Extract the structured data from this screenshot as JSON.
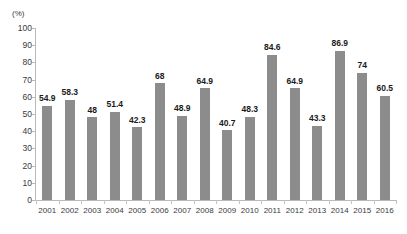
{
  "chart_data": {
    "type": "bar",
    "title": "",
    "subtitle": "",
    "xlabel": "",
    "ylabel": "(%)",
    "unit_label": "(%)",
    "ylim": [
      0,
      100
    ],
    "ytick_step": 10,
    "ytick_labels": [
      "0",
      "10",
      "20",
      "30",
      "40",
      "50",
      "60",
      "70",
      "80",
      "90",
      "100"
    ],
    "grid": false,
    "legend": null,
    "bar_color": "#8c8c8c",
    "axis_color": "#b9b9b9",
    "categories": [
      "2001",
      "2002",
      "2003",
      "2004",
      "2005",
      "2006",
      "2007",
      "2008",
      "2009",
      "2010",
      "2011",
      "2012",
      "2013",
      "2014",
      "2015",
      "2016"
    ],
    "values": [
      54.9,
      58.3,
      48,
      51.4,
      42.3,
      68,
      48.9,
      64.9,
      40.7,
      48.3,
      84.6,
      64.9,
      43.3,
      86.9,
      74,
      60.5
    ],
    "data_labels": [
      "54.9",
      "58.3",
      "48",
      "51.4",
      "42.3",
      "68",
      "48.9",
      "64.9",
      "40.7",
      "48.3",
      "84.6",
      "64.9",
      "43.3",
      "86.9",
      "74",
      "60.5"
    ]
  }
}
